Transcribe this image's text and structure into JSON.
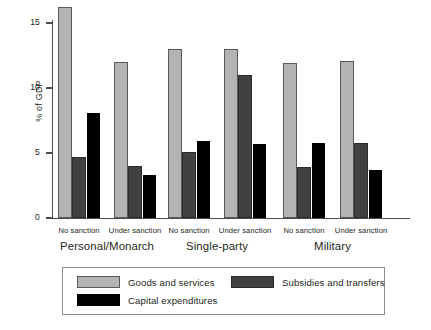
{
  "chart_data": {
    "type": "bar",
    "title": "",
    "xlabel": "",
    "ylabel": "% of GDP",
    "ylim": [
      0,
      16.8
    ],
    "yticks": [
      0,
      5,
      10,
      15
    ],
    "ytick_labels": [
      "0",
      "5",
      "10",
      "15"
    ],
    "grid": false,
    "legend_position": "bottom",
    "groups": [
      {
        "label": "Personal/Monarch",
        "subgroups": [
          {
            "label": "No sanction",
            "values": [
              16.2,
              4.7,
              8.1
            ]
          },
          {
            "label": "Under sanction",
            "values": [
              12.0,
              4.0,
              3.3
            ]
          }
        ]
      },
      {
        "label": "Single-party",
        "subgroups": [
          {
            "label": "No sanction",
            "values": [
              13.0,
              5.1,
              5.9
            ]
          },
          {
            "label": "Under sanction",
            "values": [
              13.0,
              11.0,
              5.7
            ]
          }
        ]
      },
      {
        "label": "Military",
        "subgroups": [
          {
            "label": "No sanction",
            "values": [
              11.9,
              3.9,
              5.8
            ]
          },
          {
            "label": "Under sanction",
            "values": [
              12.1,
              5.8,
              3.7
            ]
          }
        ]
      }
    ],
    "series": [
      {
        "name": "Goods and services",
        "color": "#b3b3b3",
        "values": [
          16.2,
          12.0,
          13.0,
          13.0,
          11.9,
          12.1
        ]
      },
      {
        "name": "Subsidies and transfers",
        "color": "#414042",
        "values": [
          4.7,
          4.0,
          5.1,
          11.0,
          3.9,
          5.8
        ]
      },
      {
        "name": "Capital expenditures",
        "color": "#000000",
        "values": [
          8.1,
          3.3,
          5.9,
          5.7,
          5.8,
          3.7
        ]
      }
    ],
    "categories": [
      "Personal/Monarch - No sanction",
      "Personal/Monarch - Under sanction",
      "Single-party - No sanction",
      "Single-party - Under sanction",
      "Military - No sanction",
      "Military - Under sanction"
    ]
  },
  "legend": {
    "items": [
      {
        "label": "Goods and services",
        "color": "#b3b3b3"
      },
      {
        "label": "Subsidies and transfers",
        "color": "#414042"
      },
      {
        "label": "Capital expenditures",
        "color": "#000000"
      }
    ]
  }
}
